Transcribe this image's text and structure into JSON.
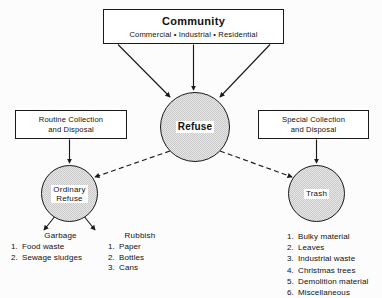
{
  "diagram": {
    "colors": {
      "circle_fill": "#c9c9c9",
      "line": "#1a1a1a",
      "box_fill": "#ffffff",
      "background": "#fcfcfc"
    },
    "community": {
      "title": "Community",
      "subtitle": "Commercial • Industrial • Residential"
    },
    "routine": {
      "line1": "Routine Collection",
      "line2": "and Disposal"
    },
    "special": {
      "line1": "Special Collection",
      "line2": "and Disposal"
    },
    "refuse": {
      "label": "Refuse"
    },
    "ordinary": {
      "label": "Ordinary\nRefuse"
    },
    "trash": {
      "label": "Trash"
    },
    "garbage": {
      "heading": "Garbage",
      "items": [
        {
          "num": "1.",
          "text": "Food  waste"
        },
        {
          "num": "2.",
          "text": "Sewage sludges"
        }
      ]
    },
    "rubbish": {
      "heading": "Rubbish",
      "items": [
        {
          "num": "1.",
          "text": "Paper"
        },
        {
          "num": "2.",
          "text": "Bottles"
        },
        {
          "num": "3.",
          "text": "Cans"
        }
      ]
    },
    "trash_list": {
      "heading": "",
      "items": [
        {
          "num": "1.",
          "text": "Bulky material"
        },
        {
          "num": "2.",
          "text": "Leaves"
        },
        {
          "num": "3.",
          "text": "Industrial  waste"
        },
        {
          "num": "4.",
          "text": "Christmas trees"
        },
        {
          "num": "5.",
          "text": "Demolition  material"
        },
        {
          "num": "6.",
          "text": "Miscellaneous"
        }
      ]
    }
  }
}
